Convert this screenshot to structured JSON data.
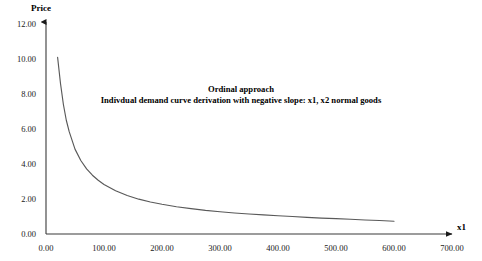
{
  "chart_data": {
    "type": "line",
    "title": "",
    "annotations": [
      {
        "text": "Ordinal approach",
        "x_px": 241,
        "y_px": 89
      },
      {
        "text": "Indivdual demand curve derivation with negative slope: x1, x2 normal goods",
        "x_px": 241,
        "y_px": 101
      }
    ],
    "xlabel": "x1",
    "ylabel": "Price",
    "xlim": [
      0,
      700
    ],
    "ylim": [
      0,
      12
    ],
    "xticks": [
      "0.00",
      "100.00",
      "200.00",
      "300.00",
      "400.00",
      "500.00",
      "600.00",
      "700.00"
    ],
    "yticks": [
      "0.00",
      "2.00",
      "4.00",
      "6.00",
      "8.00",
      "10.00",
      "12.00"
    ],
    "xtick_values": [
      0,
      100,
      200,
      300,
      400,
      500,
      600,
      700
    ],
    "ytick_values": [
      0,
      2,
      4,
      6,
      8,
      10,
      12
    ],
    "grid": false,
    "legend": false,
    "series": [
      {
        "name": "Individual demand curve",
        "color": "#595959",
        "x": [
          20,
          25,
          30,
          35,
          40,
          50,
          60,
          70,
          80,
          90,
          100,
          120,
          140,
          160,
          180,
          200,
          225,
          250,
          275,
          300,
          325,
          350,
          375,
          400,
          425,
          450,
          475,
          500,
          525,
          550,
          575,
          600
        ],
        "y": [
          10.1,
          8.6,
          7.4,
          6.5,
          5.85,
          4.85,
          4.2,
          3.72,
          3.36,
          3.07,
          2.83,
          2.47,
          2.2,
          1.99,
          1.83,
          1.7,
          1.56,
          1.45,
          1.35,
          1.27,
          1.2,
          1.14,
          1.09,
          1.04,
          1.0,
          0.95,
          0.91,
          0.88,
          0.84,
          0.8,
          0.77,
          0.73
        ]
      }
    ]
  },
  "axes": {
    "y_axis_title": "Price",
    "x_axis_title": "x1"
  }
}
